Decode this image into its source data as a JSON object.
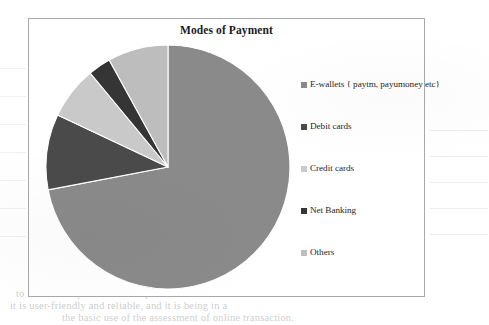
{
  "page": {
    "bleed_through": {
      "top_line": "                               ",
      "bottom_line_1": "to  use  and  easy  to  use  as  compared  to",
      "bottom_line_2": "it is user-friendly  and  reliable, and it is  being  in  a",
      "bottom_line_3": "the basic use of the  assessment  of  online  transaction."
    }
  },
  "chart_frame": {
    "title": "Modes of Payment"
  },
  "legend": {
    "items": [
      {
        "label": "E-wallets { paytm, payumoney etc}",
        "color": "#8a8a8a"
      },
      {
        "label": "Debit cards",
        "color": "#4a4a4a"
      },
      {
        "label": "Credit cards",
        "color": "#c9c9c9"
      },
      {
        "label": "Net Banking",
        "color": "#353535"
      },
      {
        "label": "Others",
        "color": "#bdbdbd"
      }
    ]
  },
  "chart_data": {
    "type": "pie",
    "title": "Modes of Payment",
    "xlabel": "",
    "ylabel": "",
    "legend_position": "right",
    "grid": false,
    "start_angle_deg": 0,
    "direction": "clockwise",
    "categories": [
      "E-wallets { paytm, payumoney etc}",
      "Debit cards",
      "Credit cards",
      "Net Banking",
      "Others"
    ],
    "values": [
      72,
      10,
      7,
      3,
      8
    ],
    "unit": "percent",
    "colors": [
      "#8a8a8a",
      "#4a4a4a",
      "#c9c9c9",
      "#353535",
      "#bdbdbd"
    ],
    "slice_outline_color": "#ffffff",
    "data_labels_shown": false
  }
}
